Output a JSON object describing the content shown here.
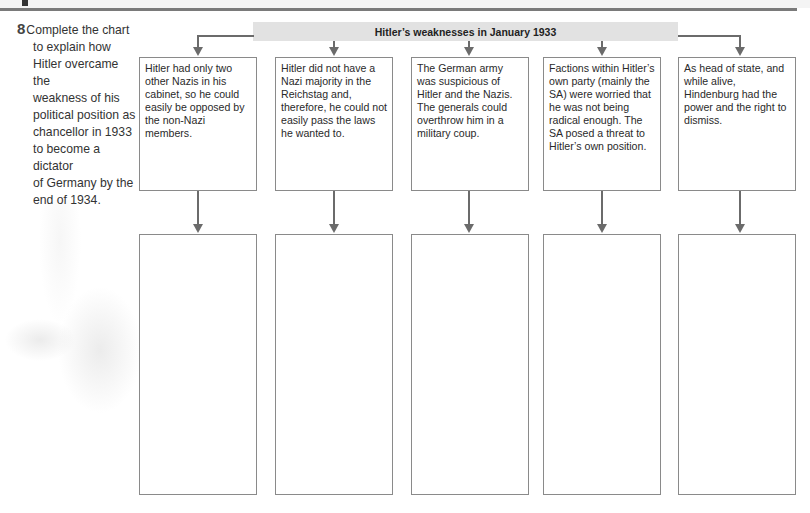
{
  "question": {
    "number": "8",
    "lines": [
      "Complete the chart",
      "to explain how",
      "Hitler overcame the",
      "weakness of his",
      "political position as",
      "chancellor in 1933",
      "to become a dictator",
      "of Germany by the",
      "end of 1934."
    ]
  },
  "chart": {
    "title": "Hitler’s weaknesses in January 1933",
    "weaknesses": [
      {
        "text": "Hitler had only two other Nazis in his cabinet, so he could easily be opposed by the non-Nazi members."
      },
      {
        "text": "Hitler did not have a Nazi majority in the Reichstag and, therefore, he could not easily pass the laws he wanted to."
      },
      {
        "text": "The German army was suspicious of Hitler and the Nazis. The generals could overthrow him in a military coup."
      },
      {
        "text": "Factions within Hitler’s own party (mainly the SA) were worried that he was not being radical enough. The SA posed a threat to Hitler’s own position."
      },
      {
        "text": "As head of state, and while alive, Hindenburg had the power and the right to dismiss."
      }
    ],
    "answers": [
      "",
      "",
      "",
      "",
      ""
    ]
  },
  "colors": {
    "header_bar": "#e2e2e2",
    "arrow": "#6b6b6b",
    "box_border": "#8a8a8a",
    "rule": "#7a7a7a"
  }
}
